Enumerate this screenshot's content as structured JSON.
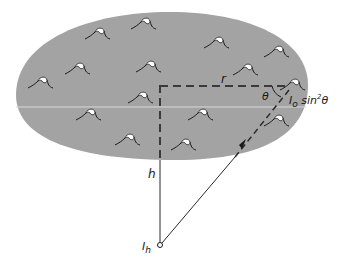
{
  "diagram": {
    "labels": {
      "r": "r",
      "theta": "θ",
      "source_intensity": "I",
      "source_sub": "o",
      "source_term": " sin",
      "source_exp": "2",
      "source_angle": "θ",
      "h": "h",
      "observer": "I",
      "observer_sub": "h"
    },
    "colors": {
      "cloud_fill": "#a3a3a3",
      "line": "#2a2a2a",
      "background": "#ffffff"
    },
    "wave_positions": [
      [
        97,
        33
      ],
      [
        143,
        23
      ],
      [
        216,
        42
      ],
      [
        276,
        51
      ],
      [
        77,
        68
      ],
      [
        148,
        66
      ],
      [
        245,
        69
      ],
      [
        40,
        82
      ],
      [
        292,
        84
      ],
      [
        140,
        97
      ],
      [
        88,
        114
      ],
      [
        200,
        114
      ],
      [
        276,
        120
      ],
      [
        127,
        139
      ],
      [
        183,
        144
      ]
    ]
  }
}
